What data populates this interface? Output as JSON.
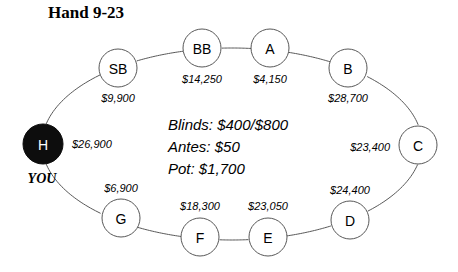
{
  "title": "Hand 9-23",
  "hero_marker": "YOU",
  "info": {
    "blinds": "Blinds: $400/$800",
    "antes": "Antes: $50",
    "pot": "Pot: $1,700"
  },
  "chart_data": {
    "type": "diagram",
    "title": "Hand 9-23",
    "subtype": "poker-table-seating",
    "table_shape": "ellipse",
    "seat_order": [
      "H",
      "SB",
      "BB",
      "A",
      "B",
      "C",
      "D",
      "E",
      "F",
      "G"
    ],
    "seats": [
      {
        "id": "H",
        "label": "H",
        "stack": "$26,900",
        "hero": true,
        "stack_side": "right",
        "cx": 43,
        "cy": 144,
        "r": 20,
        "stack_x": 72,
        "stack_y": 144
      },
      {
        "id": "SB",
        "label": "SB",
        "stack": "$9,900",
        "hero": false,
        "stack_side": "below",
        "cx": 118,
        "cy": 68,
        "r": 19,
        "stack_x": 118,
        "stack_y": 98
      },
      {
        "id": "BB",
        "label": "BB",
        "stack": "$14,250",
        "hero": false,
        "stack_side": "below",
        "cx": 202,
        "cy": 48,
        "r": 19,
        "stack_x": 202,
        "stack_y": 79
      },
      {
        "id": "A",
        "label": "A",
        "stack": "$4,150",
        "hero": false,
        "stack_side": "below",
        "cx": 270,
        "cy": 48,
        "r": 19,
        "stack_x": 270,
        "stack_y": 79
      },
      {
        "id": "B",
        "label": "B",
        "stack": "$28,700",
        "hero": false,
        "stack_side": "below",
        "cx": 348,
        "cy": 68,
        "r": 19,
        "stack_x": 348,
        "stack_y": 98
      },
      {
        "id": "C",
        "label": "C",
        "stack": "$23,400",
        "hero": false,
        "stack_side": "left",
        "cx": 418,
        "cy": 145,
        "r": 19,
        "stack_x": 390,
        "stack_y": 147
      },
      {
        "id": "D",
        "label": "D",
        "stack": "$24,400",
        "hero": false,
        "stack_side": "above",
        "cx": 350,
        "cy": 220,
        "r": 19,
        "stack_x": 350,
        "stack_y": 190
      },
      {
        "id": "E",
        "label": "E",
        "stack": "$23,050",
        "hero": false,
        "stack_side": "above",
        "cx": 268,
        "cy": 237,
        "r": 19,
        "stack_x": 268,
        "stack_y": 206
      },
      {
        "id": "F",
        "label": "F",
        "stack": "$18,300",
        "hero": false,
        "stack_side": "above",
        "cx": 200,
        "cy": 237,
        "r": 19,
        "stack_x": 200,
        "stack_y": 206
      },
      {
        "id": "G",
        "label": "G",
        "stack": "$6,900",
        "hero": false,
        "stack_side": "above",
        "cx": 121,
        "cy": 218,
        "r": 19,
        "stack_x": 121,
        "stack_y": 188
      }
    ],
    "ellipse": {
      "cx": 232,
      "cy": 144,
      "rx": 190,
      "ry": 96
    },
    "center_labels": [
      "Blinds: $400/$800",
      "Antes: $50",
      "Pot: $1,700"
    ],
    "colors": {
      "hero_fill": "#0d0d0d",
      "seat_fill": "#ffffff",
      "stroke": "#585858",
      "text": "#000000"
    }
  }
}
